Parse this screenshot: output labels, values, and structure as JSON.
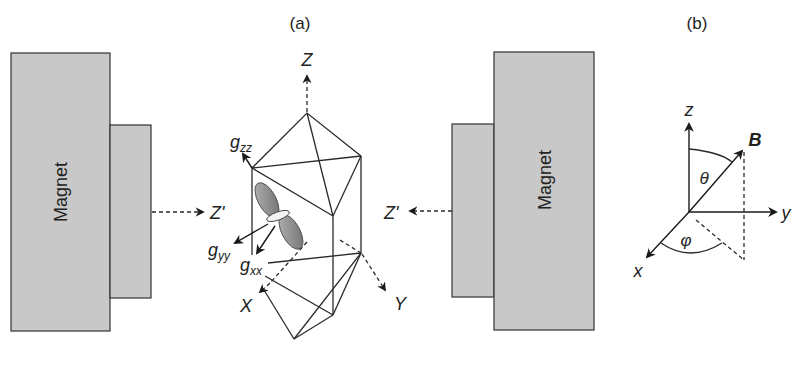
{
  "panel_a": {
    "label": "(a)",
    "left_magnet": {
      "label": "Magnet",
      "field_axis_label": "Z'"
    },
    "right_magnet": {
      "label": "Magnet",
      "field_axis_label": "Z'"
    },
    "crystal_axes": {
      "z": "Z",
      "x": "X",
      "y": "Y"
    },
    "g_tensor": {
      "gzz": {
        "main": "g",
        "sub": "zz"
      },
      "gyy": {
        "main": "g",
        "sub": "yy"
      },
      "gxx": {
        "main": "g",
        "sub": "xx"
      }
    }
  },
  "panel_b": {
    "label": "(b)",
    "axes": {
      "z": "z",
      "y": "y",
      "x": "x"
    },
    "field_vector": "B",
    "polar_angle": "θ",
    "azimuthal_angle": "φ"
  },
  "colors": {
    "magnet_fill": "#c8c8c8",
    "line": "#2a2a2a",
    "orbital_fill": "#8a8a8a"
  }
}
